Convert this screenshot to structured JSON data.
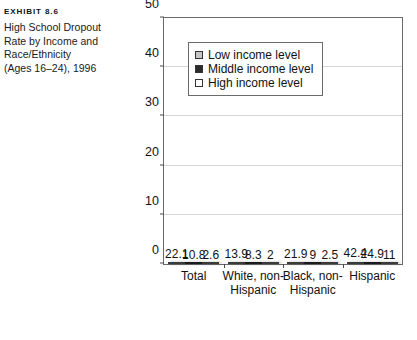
{
  "exhibit": {
    "number": "EXHIBIT 8.6",
    "title_lines": [
      "High School Dropout",
      "Rate by Income and",
      "Race/Ethnicity",
      "(Ages 16–24), 1996"
    ]
  },
  "legend": {
    "items": [
      {
        "label": "Low income level",
        "swatch": "low",
        "color": "#c6c6c6"
      },
      {
        "label": "Middle income level",
        "swatch": "mid",
        "color": "#2b2b2b"
      },
      {
        "label": "High income level",
        "swatch": "high",
        "color": "#ffffff"
      }
    ]
  },
  "axis": {
    "y_ticks": [
      "0",
      "10",
      "20",
      "30",
      "40",
      "50"
    ]
  },
  "source_note": "",
  "chart_data": {
    "type": "bar",
    "title": "High School Dropout Rate by Income and Race/Ethnicity (Ages 16–24), 1996",
    "categories": [
      "Total",
      "White, non-Hispanic",
      "Black, non-Hispanic",
      "Hispanic"
    ],
    "category_label_lines": [
      [
        "Total"
      ],
      [
        "White, non-",
        "Hispanic"
      ],
      [
        "Black, non-",
        "Hispanic"
      ],
      [
        "Hispanic"
      ]
    ],
    "series": [
      {
        "name": "Low income level",
        "color": "#c6c6c6",
        "values": [
          22.1,
          13.9,
          21.9,
          42.4
        ],
        "labels": [
          "22.1",
          "13.9",
          "21.9",
          "42.4"
        ]
      },
      {
        "name": "Middle income level",
        "color": "#2b2b2b",
        "values": [
          10.8,
          8.3,
          9,
          24.9
        ],
        "labels": [
          "10.8",
          "8.3",
          "9",
          "24.9"
        ]
      },
      {
        "name": "High income level",
        "color": "#ffffff",
        "values": [
          2.6,
          2,
          2.5,
          11
        ],
        "labels": [
          "2.6",
          "2",
          "2.5",
          "11"
        ]
      }
    ],
    "xlabel": "",
    "ylabel": "",
    "ylim": [
      0,
      50
    ],
    "ytick_step": 10,
    "grid": true,
    "legend_position": "inside-upper-left"
  }
}
